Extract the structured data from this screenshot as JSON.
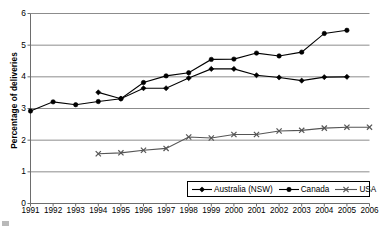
{
  "chart_data": {
    "type": "line",
    "title": "",
    "xlabel": "",
    "ylabel": "Percentage of deliveries",
    "grid": true,
    "legend_position": "bottom-right",
    "xlim": [
      1991,
      2006
    ],
    "ylim": [
      0,
      6
    ],
    "yticks": [
      0,
      1,
      2,
      3,
      4,
      5,
      6
    ],
    "x": [
      1991,
      1992,
      1993,
      1994,
      1995,
      1996,
      1997,
      1998,
      1999,
      2000,
      2001,
      2002,
      2003,
      2004,
      2005,
      2006
    ],
    "categories": [
      "1991",
      "1992",
      "1993",
      "1994",
      "1995",
      "1996",
      "1997",
      "1998",
      "1999",
      "2000",
      "2001",
      "2002",
      "2003",
      "2004",
      "2005",
      "2006"
    ],
    "series": [
      {
        "name": "Australia (NSW)",
        "marker": "diamond",
        "color": "#000000",
        "x": [
          1994,
          1995,
          1996,
          1997,
          1998,
          1999,
          2000,
          2001,
          2002,
          2003,
          2004,
          2005
        ],
        "values": [
          3.51,
          3.31,
          3.64,
          3.64,
          3.96,
          4.25,
          4.25,
          4.05,
          3.98,
          3.88,
          3.99,
          4.0
        ]
      },
      {
        "name": "Canada",
        "marker": "circle",
        "color": "#000000",
        "x": [
          1991,
          1992,
          1993,
          1994,
          1995,
          1996,
          1997,
          1998,
          1999,
          2000,
          2001,
          2002,
          2003,
          2004,
          2005
        ],
        "values": [
          2.92,
          3.21,
          3.12,
          3.22,
          3.31,
          3.82,
          4.03,
          4.13,
          4.55,
          4.56,
          4.75,
          4.66,
          4.78,
          5.37,
          5.47
        ]
      },
      {
        "name": "USA",
        "marker": "cross",
        "color": "#555555",
        "x": [
          1994,
          1995,
          1996,
          1997,
          1998,
          1999,
          2000,
          2001,
          2002,
          2003,
          2004,
          2005,
          2006
        ],
        "values": [
          1.57,
          1.6,
          1.68,
          1.74,
          2.1,
          2.07,
          2.18,
          2.18,
          2.29,
          2.31,
          2.38,
          2.41,
          2.41
        ]
      }
    ]
  },
  "legend": {
    "items": [
      {
        "label": "Australia (NSW)"
      },
      {
        "label": "Canada"
      },
      {
        "label": "USA"
      }
    ]
  }
}
